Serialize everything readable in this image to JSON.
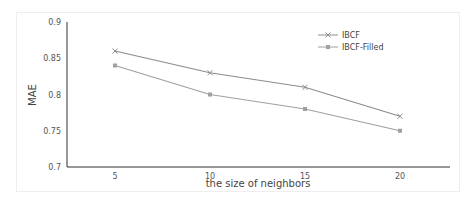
{
  "chart_data": {
    "type": "line",
    "title": "",
    "xlabel": "the size of neighbors",
    "ylabel": "MAE",
    "categories": [
      "5",
      "10",
      "15",
      "20"
    ],
    "x": [
      5,
      10,
      15,
      20
    ],
    "ylim": [
      0.7,
      0.9
    ],
    "yticks": [
      "0.7",
      "0.75",
      "0.8",
      "0.85",
      "0.9"
    ],
    "yticks_values": [
      0.7,
      0.75,
      0.8,
      0.85,
      0.9
    ],
    "grid": false,
    "legend": "top-right",
    "series": [
      {
        "name": "IBCF",
        "values": [
          0.86,
          0.83,
          0.81,
          0.77
        ],
        "color": "#8c8c8c",
        "marker": "x"
      },
      {
        "name": "IBCF-Filled",
        "values": [
          0.84,
          0.8,
          0.78,
          0.75
        ],
        "color": "#a0a0a0",
        "marker": "square"
      }
    ]
  }
}
